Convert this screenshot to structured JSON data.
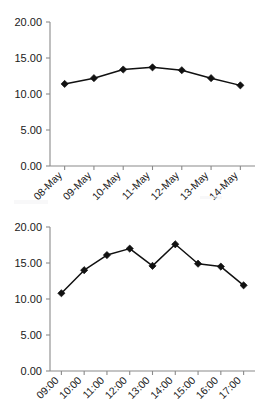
{
  "chart_data": [
    {
      "type": "line",
      "title": "",
      "xlabel": "",
      "ylabel": "",
      "categories": [
        "08-May",
        "09-May",
        "10-May",
        "11-May",
        "12-May",
        "13-May",
        "14-May"
      ],
      "values": [
        11.4,
        12.2,
        13.4,
        13.7,
        13.3,
        12.2,
        11.2
      ],
      "ylim": [
        0,
        20
      ],
      "yticks": [
        0,
        5,
        10,
        15,
        20
      ],
      "ytick_labels": [
        "0.00",
        "5.00",
        "10.00",
        "15.00",
        "20.00"
      ],
      "grid": false,
      "legend": "none",
      "marker": "diamond",
      "series_color": "#111111",
      "axis_color": "#8a8a8a",
      "xtick_rotation": -45
    },
    {
      "type": "line",
      "title": "",
      "xlabel": "",
      "ylabel": "",
      "categories": [
        "09:00",
        "10:00",
        "11:00",
        "12:00",
        "13:00",
        "14:00",
        "15:00",
        "16:00",
        "17:00"
      ],
      "values": [
        10.8,
        14.0,
        16.1,
        17.0,
        14.6,
        17.6,
        14.9,
        14.5,
        11.9
      ],
      "ylim": [
        0,
        20
      ],
      "yticks": [
        0,
        5,
        10,
        15,
        20
      ],
      "ytick_labels": [
        "0.00",
        "5.00",
        "10.00",
        "15.00",
        "20.00"
      ],
      "grid": false,
      "legend": "none",
      "marker": "diamond",
      "series_color": "#111111",
      "axis_color": "#8a8a8a",
      "xtick_rotation": -45
    }
  ],
  "page": {
    "background": "#ffffff"
  }
}
